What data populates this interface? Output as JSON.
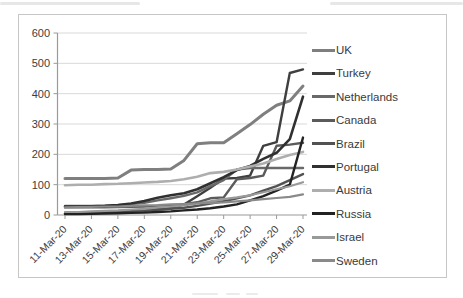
{
  "chart_data": {
    "type": "line",
    "title": "",
    "xlabel": "",
    "ylabel": "",
    "x": [
      "11-Mar-20",
      "12-Mar-20",
      "13-Mar-20",
      "14-Mar-20",
      "15-Mar-20",
      "16-Mar-20",
      "17-Mar-20",
      "18-Mar-20",
      "19-Mar-20",
      "20-Mar-20",
      "21-Mar-20",
      "22-Mar-20",
      "23-Mar-20",
      "24-Mar-20",
      "25-Mar-20",
      "26-Mar-20",
      "27-Mar-20",
      "28-Mar-20",
      "29-Mar-20"
    ],
    "x_tick_labels": [
      "11-Mar-20",
      "13-Mar-20",
      "15-Mar-20",
      "17-Mar-20",
      "19-Mar-20",
      "21-Mar-20",
      "23-Mar-20",
      "25-Mar-20",
      "27-Mar-20",
      "29-Mar-20"
    ],
    "y_tick_labels": [
      "600",
      "500",
      "400",
      "300",
      "200",
      "100",
      "0"
    ],
    "y_ticks": [
      0,
      100,
      200,
      300,
      400,
      500,
      600
    ],
    "ylim": [
      0,
      600
    ],
    "grid": "horizontal",
    "legend_position": "right",
    "series": [
      {
        "name": "UK",
        "color": "#7f7f7f",
        "width": 3,
        "values": [
          120,
          120,
          120,
          120,
          122,
          148,
          150,
          150,
          152,
          180,
          235,
          238,
          238,
          268,
          298,
          332,
          362,
          376,
          425
        ]
      },
      {
        "name": "Turkey",
        "color": "#3f3f3f",
        "width": 2.4,
        "values": [
          5,
          5,
          6,
          8,
          10,
          12,
          15,
          18,
          22,
          35,
          62,
          90,
          120,
          122,
          130,
          228,
          240,
          468,
          480
        ]
      },
      {
        "name": "Netherlands",
        "color": "#696969",
        "width": 2.4,
        "values": [
          30,
          30,
          30,
          30,
          32,
          36,
          40,
          48,
          55,
          63,
          75,
          95,
          115,
          150,
          155,
          155,
          155,
          155,
          155
        ]
      },
      {
        "name": "Canada",
        "color": "#5b5b5b",
        "width": 2.4,
        "values": [
          25,
          25,
          25,
          25,
          26,
          27,
          28,
          30,
          32,
          36,
          42,
          55,
          58,
          118,
          122,
          130,
          228,
          232,
          238
        ]
      },
      {
        "name": "Brazil",
        "color": "#525252",
        "width": 2.4,
        "values": [
          5,
          6,
          8,
          10,
          10,
          12,
          14,
          18,
          20,
          24,
          30,
          38,
          45,
          55,
          65,
          80,
          95,
          115,
          135
        ]
      },
      {
        "name": "Portugal",
        "color": "#303030",
        "width": 2.6,
        "values": [
          28,
          28,
          29,
          30,
          33,
          38,
          46,
          57,
          65,
          72,
          85,
          105,
          125,
          148,
          162,
          185,
          205,
          250,
          390
        ]
      },
      {
        "name": "Austria",
        "color": "#aeaeae",
        "width": 2.6,
        "values": [
          98,
          100,
          100,
          102,
          103,
          105,
          107,
          109,
          112,
          118,
          126,
          138,
          142,
          150,
          160,
          170,
          185,
          198,
          208
        ]
      },
      {
        "name": "Russia",
        "color": "#222222",
        "width": 2.4,
        "values": [
          3,
          3,
          4,
          5,
          6,
          7,
          8,
          10,
          12,
          15,
          18,
          22,
          28,
          35,
          48,
          62,
          80,
          100,
          255
        ]
      },
      {
        "name": "Israel",
        "color": "#999999",
        "width": 2.2,
        "values": [
          10,
          10,
          12,
          14,
          15,
          18,
          20,
          25,
          28,
          32,
          38,
          45,
          52,
          58,
          65,
          75,
          85,
          95,
          108
        ]
      },
      {
        "name": "Sweden",
        "color": "#8a8a8a",
        "width": 2.2,
        "values": [
          25,
          26,
          27,
          28,
          28,
          30,
          32,
          33,
          35,
          36,
          38,
          40,
          42,
          45,
          48,
          52,
          56,
          60,
          68
        ]
      }
    ],
    "colors": {
      "axis": "#9a9a9a",
      "gridline": "#d9d9d9",
      "label_text": "#3d3d3d"
    }
  }
}
